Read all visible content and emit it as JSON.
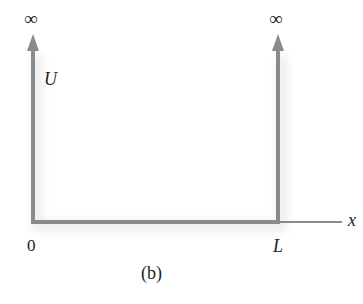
{
  "diagram": {
    "labels": {
      "inf_left": "∞",
      "inf_right": "∞",
      "y_axis": "U",
      "x_axis": "x",
      "origin": "0",
      "well_edge": "L",
      "caption": "(b)"
    },
    "colors": {
      "well": "#8a8a8a",
      "axis": "#555555",
      "text": "#222222",
      "shadow": "#e6e6e6"
    }
  }
}
